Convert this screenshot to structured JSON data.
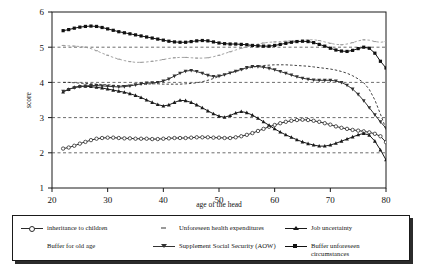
{
  "chart_data": {
    "type": "line",
    "title": "",
    "xlabel": "age of the head",
    "ylabel": "score",
    "xlim": [
      20,
      80
    ],
    "ylim": [
      1,
      6
    ],
    "xticks": [
      20,
      30,
      40,
      50,
      60,
      70,
      80
    ],
    "yticks": [
      1,
      2,
      3,
      4,
      5,
      6
    ],
    "grid": "horizontal-dashed",
    "legend_position": "below-plot",
    "x": [
      22,
      23,
      24,
      25,
      26,
      27,
      28,
      29,
      30,
      31,
      32,
      33,
      34,
      35,
      36,
      37,
      38,
      39,
      40,
      41,
      42,
      43,
      44,
      45,
      46,
      47,
      48,
      49,
      50,
      51,
      52,
      53,
      54,
      55,
      56,
      57,
      58,
      59,
      60,
      61,
      62,
      63,
      64,
      65,
      66,
      67,
      68,
      69,
      70,
      71,
      72,
      73,
      74,
      75,
      76,
      77,
      78,
      79,
      80
    ],
    "series": [
      {
        "name": "inheritance to children",
        "marker": "open-circle",
        "color": "#2b2b2b",
        "values": [
          2.12,
          2.15,
          2.2,
          2.26,
          2.31,
          2.36,
          2.4,
          2.42,
          2.43,
          2.43,
          2.42,
          2.41,
          2.41,
          2.4,
          2.4,
          2.4,
          2.39,
          2.39,
          2.4,
          2.41,
          2.42,
          2.42,
          2.42,
          2.43,
          2.44,
          2.44,
          2.44,
          2.43,
          2.43,
          2.42,
          2.42,
          2.44,
          2.47,
          2.51,
          2.56,
          2.62,
          2.68,
          2.74,
          2.79,
          2.84,
          2.88,
          2.91,
          2.93,
          2.94,
          2.93,
          2.91,
          2.88,
          2.84,
          2.8,
          2.75,
          2.71,
          2.68,
          2.65,
          2.63,
          2.61,
          2.58,
          2.54,
          2.47,
          2.3
        ]
      },
      {
        "name": "Unforeseen health expenditures",
        "marker": "small-dash",
        "color": "#9a9a9a",
        "values": [
          5.05,
          5.04,
          5.03,
          5.02,
          5.0,
          4.96,
          4.9,
          4.83,
          4.77,
          4.71,
          4.66,
          4.62,
          4.59,
          4.57,
          4.57,
          4.58,
          4.6,
          4.62,
          4.65,
          4.68,
          4.7,
          4.71,
          4.71,
          4.7,
          4.69,
          4.69,
          4.7,
          4.73,
          4.77,
          4.82,
          4.87,
          4.92,
          4.97,
          5.01,
          5.05,
          5.09,
          5.12,
          5.14,
          5.15,
          5.16,
          5.17,
          5.18,
          5.19,
          5.2,
          5.21,
          5.21,
          5.19,
          5.15,
          5.11,
          5.08,
          5.07,
          5.09,
          5.13,
          5.18,
          5.21,
          5.2,
          5.16,
          5.14,
          5.16
        ]
      },
      {
        "name": "Job uncertainty",
        "marker": "filled-triangle",
        "color": "#1a1a1a",
        "values": [
          3.73,
          3.8,
          3.86,
          3.89,
          3.89,
          3.88,
          3.86,
          3.84,
          3.81,
          3.78,
          3.75,
          3.72,
          3.68,
          3.63,
          3.57,
          3.5,
          3.43,
          3.37,
          3.33,
          3.36,
          3.43,
          3.49,
          3.48,
          3.43,
          3.36,
          3.28,
          3.19,
          3.11,
          3.04,
          3.01,
          3.06,
          3.13,
          3.17,
          3.14,
          3.07,
          2.98,
          2.88,
          2.78,
          2.68,
          2.59,
          2.51,
          2.44,
          2.37,
          2.31,
          2.26,
          2.22,
          2.19,
          2.19,
          2.22,
          2.27,
          2.33,
          2.39,
          2.45,
          2.51,
          2.55,
          2.5,
          2.33,
          2.08,
          1.8
        ]
      },
      {
        "name": "Buffer for old age",
        "marker": "none",
        "color": "#2b2b2b",
        "values": [
          4.0,
          4.0,
          3.99,
          3.98,
          3.97,
          3.96,
          3.95,
          3.94,
          3.93,
          3.92,
          3.91,
          3.91,
          3.92,
          3.93,
          3.94,
          3.95,
          3.96,
          3.96,
          3.95,
          3.95,
          3.95,
          3.95,
          3.96,
          3.97,
          3.99,
          4.02,
          4.06,
          4.11,
          4.17,
          4.22,
          4.27,
          4.31,
          4.35,
          4.39,
          4.43,
          4.46,
          4.48,
          4.49,
          4.5,
          4.5,
          4.5,
          4.49,
          4.48,
          4.47,
          4.46,
          4.44,
          4.42,
          4.4,
          4.38,
          4.35,
          4.31,
          4.26,
          4.19,
          4.1,
          3.99,
          3.8,
          3.5,
          3.1,
          2.68
        ]
      },
      {
        "name": "Supplement Social Security (AOW)",
        "marker": "down-triangle",
        "color": "#333333",
        "values": [
          3.75,
          3.8,
          3.85,
          3.88,
          3.9,
          3.91,
          3.91,
          3.9,
          3.89,
          3.88,
          3.87,
          3.88,
          3.9,
          3.93,
          3.96,
          3.98,
          3.99,
          4.0,
          4.04,
          4.1,
          4.18,
          4.26,
          4.32,
          4.34,
          4.31,
          4.26,
          4.2,
          4.17,
          4.18,
          4.22,
          4.27,
          4.32,
          4.37,
          4.42,
          4.45,
          4.45,
          4.43,
          4.4,
          4.36,
          4.31,
          4.26,
          4.21,
          4.16,
          4.12,
          4.09,
          4.07,
          4.06,
          4.06,
          4.06,
          4.04,
          4.0,
          3.92,
          3.81,
          3.66,
          3.48,
          3.28,
          3.08,
          2.88,
          2.7
        ]
      },
      {
        "name": "Buffer unforeseen circumstances",
        "marker": "filled-square",
        "color": "#111111",
        "values": [
          5.47,
          5.5,
          5.54,
          5.57,
          5.59,
          5.6,
          5.59,
          5.56,
          5.52,
          5.48,
          5.44,
          5.41,
          5.38,
          5.35,
          5.32,
          5.29,
          5.26,
          5.23,
          5.2,
          5.17,
          5.15,
          5.14,
          5.14,
          5.16,
          5.18,
          5.19,
          5.18,
          5.15,
          5.12,
          5.1,
          5.09,
          5.09,
          5.08,
          5.07,
          5.05,
          5.04,
          5.03,
          5.03,
          5.05,
          5.08,
          5.11,
          5.14,
          5.16,
          5.17,
          5.16,
          5.13,
          5.08,
          5.03,
          4.97,
          4.92,
          4.89,
          4.88,
          4.91,
          4.96,
          5.0,
          4.97,
          4.83,
          4.6,
          4.41
        ]
      }
    ]
  },
  "axes": {
    "ylabel": "score",
    "xlabel": "age of the head",
    "ytick_labels": [
      "1",
      "2",
      "3",
      "4",
      "5",
      "6"
    ],
    "xtick_labels": [
      "20",
      "30",
      "40",
      "50",
      "60",
      "70",
      "80"
    ]
  },
  "legend": {
    "entries": [
      {
        "label": "inheritance to children",
        "marker": "open-circle",
        "has_line": true,
        "color": "#2b2b2b"
      },
      {
        "label": "Unforeseen health expenditures",
        "marker": "small-dash",
        "has_line": false,
        "color": "#9a9a9a"
      },
      {
        "label": "Job uncertainty",
        "marker": "filled-triangle",
        "has_line": true,
        "color": "#1a1a1a"
      },
      {
        "label": "Buffer for old age",
        "marker": "none",
        "has_line": false,
        "color": "#2b2b2b"
      },
      {
        "label": "Supplement Social Security (AOW)",
        "marker": "down-triangle",
        "has_line": true,
        "color": "#333333"
      },
      {
        "label": "Buffer unforeseen circumstances",
        "marker": "filled-square",
        "has_line": true,
        "color": "#111111"
      }
    ]
  }
}
